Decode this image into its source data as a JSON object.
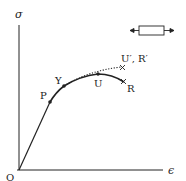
{
  "diagram": {
    "type": "stress-strain curve",
    "axes": {
      "y_label": "σ",
      "x_label": "ϵ",
      "origin_label": "O"
    },
    "points": {
      "P": "P",
      "Y": "Y",
      "U": "U",
      "R": "R",
      "U_prime_R_prime": "U′, R′"
    },
    "specimen_icon": "tension-bar-icon",
    "colors": {
      "line": "#222222",
      "background": "#ffffff"
    }
  }
}
